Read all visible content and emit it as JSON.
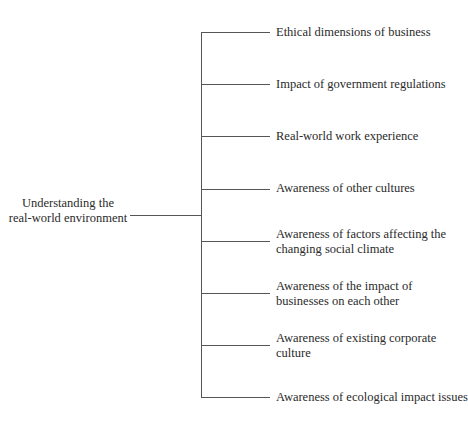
{
  "diagram": {
    "root": {
      "line1": "Understanding the",
      "line2": "real-world environment"
    },
    "branches": [
      {
        "line1": "Ethical dimensions of business",
        "line2": ""
      },
      {
        "line1": "Impact of government regulations",
        "line2": ""
      },
      {
        "line1": "Real-world work experience",
        "line2": ""
      },
      {
        "line1": "Awareness of other cultures",
        "line2": ""
      },
      {
        "line1": "Awareness of factors affecting the",
        "line2": "changing social climate"
      },
      {
        "line1": "Awareness of the impact of",
        "line2": "businesses on each other"
      },
      {
        "line1": "Awareness of existing corporate",
        "line2": "culture"
      },
      {
        "line1": "Awareness of ecological impact issues",
        "line2": ""
      }
    ],
    "line_color": "#555555"
  }
}
